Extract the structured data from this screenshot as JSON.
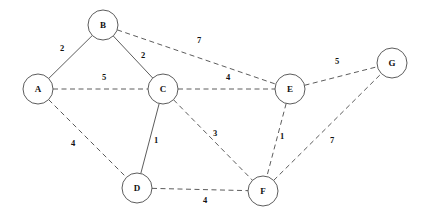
{
  "diagram": {
    "type": "weighted-undirected-graph",
    "background_color": "#ffffff",
    "stroke_color": "#4a4a4a",
    "text_color": "#111111",
    "nodes": [
      {
        "id": "A",
        "label": "A",
        "cx": 38,
        "cy": 89,
        "r": 15
      },
      {
        "id": "B",
        "label": "B",
        "cx": 103,
        "cy": 25,
        "r": 15
      },
      {
        "id": "C",
        "label": "C",
        "cx": 163,
        "cy": 89,
        "r": 15
      },
      {
        "id": "D",
        "label": "D",
        "cx": 137,
        "cy": 188,
        "r": 15
      },
      {
        "id": "E",
        "label": "E",
        "cx": 290,
        "cy": 89,
        "r": 15
      },
      {
        "id": "F",
        "label": "F",
        "cx": 263,
        "cy": 191,
        "r": 15
      },
      {
        "id": "G",
        "label": "G",
        "cx": 392,
        "cy": 63,
        "r": 15
      }
    ],
    "edges": [
      {
        "from": "A",
        "to": "B",
        "weight": "2",
        "style": "solid",
        "lx": 62,
        "ly": 48
      },
      {
        "from": "B",
        "to": "C",
        "weight": "2",
        "style": "solid",
        "lx": 143,
        "ly": 55
      },
      {
        "from": "A",
        "to": "C",
        "weight": "5",
        "style": "dashed",
        "lx": 104,
        "ly": 77
      },
      {
        "from": "B",
        "to": "E",
        "weight": "7",
        "style": "dashed",
        "lx": 199,
        "ly": 40
      },
      {
        "from": "C",
        "to": "E",
        "weight": "4",
        "style": "dashed",
        "lx": 228,
        "ly": 77
      },
      {
        "from": "E",
        "to": "G",
        "weight": "5",
        "style": "dashed",
        "lx": 337,
        "ly": 61
      },
      {
        "from": "A",
        "to": "D",
        "weight": "4",
        "style": "dashed",
        "lx": 73,
        "ly": 143
      },
      {
        "from": "C",
        "to": "D",
        "weight": "1",
        "style": "solid",
        "lx": 156,
        "ly": 140
      },
      {
        "from": "C",
        "to": "F",
        "weight": "3",
        "style": "dashed",
        "lx": 215,
        "ly": 133
      },
      {
        "from": "E",
        "to": "F",
        "weight": "1",
        "style": "dashed",
        "lx": 282,
        "ly": 136
      },
      {
        "from": "F",
        "to": "G",
        "weight": "7",
        "style": "dashed",
        "lx": 332,
        "ly": 140
      },
      {
        "from": "D",
        "to": "F",
        "weight": "4",
        "style": "dashed",
        "lx": 205,
        "ly": 200
      }
    ]
  }
}
